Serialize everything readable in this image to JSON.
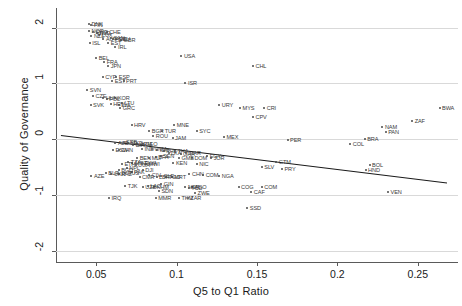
{
  "chart_data": {
    "type": "scatter",
    "title": "",
    "xlabel": "Q5 to Q1 Ratio",
    "ylabel": "Quality of Governance",
    "xlim": [
      0.025,
      0.275
    ],
    "ylim": [
      -2.2,
      2.35
    ],
    "xticks": [
      0.05,
      0.1,
      0.15,
      0.2,
      0.25
    ],
    "xticklabels": [
      "0.05",
      "0.1",
      "0.15",
      "0.2",
      "0.25"
    ],
    "yticks": [
      -2,
      -1,
      0,
      1,
      2
    ],
    "yticklabels": [
      "-2",
      "-1",
      "0",
      "1",
      "2"
    ],
    "grid": "horizontal",
    "legend": "none",
    "marker_color": "#4a4a4a",
    "label_color": "#3a3a3a",
    "fit_line_color": "#1a1a1a",
    "fit_line": {
      "x0": 0.028,
      "y0": 0.07,
      "x1": 0.268,
      "y1": -0.78,
      "slope": -3.54,
      "intercept": 0.169
    },
    "points": [
      {
        "label": "DNK",
        "x": 0.0455,
        "y": 2.07
      },
      {
        "label": "FIN",
        "x": 0.047,
        "y": 2.04
      },
      {
        "label": "NOR",
        "x": 0.0455,
        "y": 1.93
      },
      {
        "label": "SWE",
        "x": 0.048,
        "y": 1.92
      },
      {
        "label": "NLD",
        "x": 0.0505,
        "y": 1.91
      },
      {
        "label": "CHE",
        "x": 0.0565,
        "y": 1.92
      },
      {
        "label": "LUX",
        "x": 0.052,
        "y": 1.86
      },
      {
        "label": "NZL",
        "x": 0.047,
        "y": 1.84
      },
      {
        "label": "AUT",
        "x": 0.0545,
        "y": 1.8
      },
      {
        "label": "CAN",
        "x": 0.059,
        "y": 1.82
      },
      {
        "label": "AUS",
        "x": 0.0605,
        "y": 1.8
      },
      {
        "label": "DEU",
        "x": 0.0625,
        "y": 1.79
      },
      {
        "label": "GBR",
        "x": 0.0655,
        "y": 1.77
      },
      {
        "label": "ISL",
        "x": 0.046,
        "y": 1.73
      },
      {
        "label": "EST",
        "x": 0.0575,
        "y": 1.72
      },
      {
        "label": "IRL",
        "x": 0.062,
        "y": 1.66
      },
      {
        "label": "BEL",
        "x": 0.05,
        "y": 1.46
      },
      {
        "label": "FRA",
        "x": 0.055,
        "y": 1.38
      },
      {
        "label": "JPN",
        "x": 0.0575,
        "y": 1.31
      },
      {
        "label": "USA",
        "x": 0.103,
        "y": 1.49
      },
      {
        "label": "CHL",
        "x": 0.1475,
        "y": 1.31
      },
      {
        "label": "CYP",
        "x": 0.054,
        "y": 1.11
      },
      {
        "label": "ESP",
        "x": 0.0625,
        "y": 1.11
      },
      {
        "label": "EST2",
        "x": 0.06,
        "y": 1.05
      },
      {
        "label": "PRT",
        "x": 0.067,
        "y": 1.05
      },
      {
        "label": "ISR",
        "x": 0.1055,
        "y": 1.01
      },
      {
        "label": "SVN",
        "x": 0.0445,
        "y": 0.88
      },
      {
        "label": "CZE",
        "x": 0.048,
        "y": 0.78
      },
      {
        "label": "HUN",
        "x": 0.0545,
        "y": 0.73
      },
      {
        "label": "POL",
        "x": 0.0565,
        "y": 0.72
      },
      {
        "label": "KOR",
        "x": 0.062,
        "y": 0.74
      },
      {
        "label": "SVK",
        "x": 0.0465,
        "y": 0.62
      },
      {
        "label": "HRV2",
        "x": 0.059,
        "y": 0.63
      },
      {
        "label": "LVA",
        "x": 0.064,
        "y": 0.62
      },
      {
        "label": "LTU",
        "x": 0.066,
        "y": 0.64
      },
      {
        "label": "GRC",
        "x": 0.065,
        "y": 0.55
      },
      {
        "label": "URY",
        "x": 0.1265,
        "y": 0.62
      },
      {
        "label": "MYS",
        "x": 0.1395,
        "y": 0.56
      },
      {
        "label": "CRI",
        "x": 0.1545,
        "y": 0.56
      },
      {
        "label": "CPV",
        "x": 0.1475,
        "y": 0.4
      },
      {
        "label": "HRV",
        "x": 0.072,
        "y": 0.25
      },
      {
        "label": "MNE",
        "x": 0.0985,
        "y": 0.26
      },
      {
        "label": "BGR",
        "x": 0.083,
        "y": 0.15
      },
      {
        "label": "TUR",
        "x": 0.091,
        "y": 0.15
      },
      {
        "label": "SYC",
        "x": 0.1125,
        "y": 0.15
      },
      {
        "label": "ROU",
        "x": 0.0855,
        "y": 0.06
      },
      {
        "label": "JAM",
        "x": 0.0975,
        "y": 0.03
      },
      {
        "label": "MEX",
        "x": 0.1295,
        "y": 0.04
      },
      {
        "label": "PER",
        "x": 0.169,
        "y": -0.02
      },
      {
        "label": "NAM",
        "x": 0.228,
        "y": 0.22
      },
      {
        "label": "PAN",
        "x": 0.23,
        "y": 0.12
      },
      {
        "label": "BWA",
        "x": 0.2635,
        "y": 0.56
      },
      {
        "label": "ZAF",
        "x": 0.2465,
        "y": 0.33
      },
      {
        "label": "BRA",
        "x": 0.217,
        "y": 0.0
      },
      {
        "label": "COL",
        "x": 0.208,
        "y": -0.08
      },
      {
        "label": "ALB",
        "x": 0.062,
        "y": -0.06
      },
      {
        "label": "SRB",
        "x": 0.067,
        "y": -0.05
      },
      {
        "label": "MKD",
        "x": 0.07,
        "y": -0.07
      },
      {
        "label": "BIH",
        "x": 0.073,
        "y": -0.1
      },
      {
        "label": "ARM",
        "x": 0.0755,
        "y": -0.08
      },
      {
        "label": "GEO",
        "x": 0.079,
        "y": -0.09
      },
      {
        "label": "IND",
        "x": 0.0785,
        "y": -0.17
      },
      {
        "label": "CHN",
        "x": 0.064,
        "y": -0.19
      },
      {
        "label": "ESW",
        "x": 0.0605,
        "y": -0.2
      },
      {
        "label": "VNM",
        "x": 0.0845,
        "y": -0.18
      },
      {
        "label": "IDN",
        "x": 0.088,
        "y": -0.2
      },
      {
        "label": "PHL",
        "x": 0.092,
        "y": -0.22
      },
      {
        "label": "LKA",
        "x": 0.095,
        "y": -0.24
      },
      {
        "label": "THA",
        "x": 0.099,
        "y": -0.22
      },
      {
        "label": "GHA",
        "x": 0.1025,
        "y": -0.26
      },
      {
        "label": "MAR",
        "x": 0.106,
        "y": -0.24
      },
      {
        "label": "BEN",
        "x": 0.0755,
        "y": -0.34
      },
      {
        "label": "MLI",
        "x": 0.083,
        "y": -0.33
      },
      {
        "label": "BFA",
        "x": 0.087,
        "y": -0.32
      },
      {
        "label": "SEN",
        "x": 0.09,
        "y": -0.3
      },
      {
        "label": "GMB",
        "x": 0.1015,
        "y": -0.33
      },
      {
        "label": "DOM",
        "x": 0.1095,
        "y": -0.33
      },
      {
        "label": "EGY",
        "x": 0.119,
        "y": -0.31
      },
      {
        "label": "JOR",
        "x": 0.1215,
        "y": -0.33
      },
      {
        "label": "KEN",
        "x": 0.098,
        "y": -0.43
      },
      {
        "label": "NIC",
        "x": 0.1125,
        "y": -0.44
      },
      {
        "label": "GTM",
        "x": 0.162,
        "y": -0.41
      },
      {
        "label": "SLV",
        "x": 0.153,
        "y": -0.49
      },
      {
        "label": "PRY",
        "x": 0.1655,
        "y": -0.53
      },
      {
        "label": "BOL",
        "x": 0.22,
        "y": -0.47
      },
      {
        "label": "HND",
        "x": 0.2175,
        "y": -0.56
      },
      {
        "label": "MOZ",
        "x": 0.0725,
        "y": -0.42
      },
      {
        "label": "ETH",
        "x": 0.066,
        "y": -0.44
      },
      {
        "label": "TZA",
        "x": 0.07,
        "y": -0.4
      },
      {
        "label": "UGA",
        "x": 0.0745,
        "y": -0.47
      },
      {
        "label": "RWA",
        "x": 0.0785,
        "y": -0.42
      },
      {
        "label": "MWI",
        "x": 0.081,
        "y": -0.45
      },
      {
        "label": "DJI",
        "x": 0.079,
        "y": -0.55
      },
      {
        "label": "NPL",
        "x": 0.069,
        "y": -0.52
      },
      {
        "label": "BGD",
        "x": 0.064,
        "y": -0.55
      },
      {
        "label": "PAK",
        "x": 0.072,
        "y": -0.58
      },
      {
        "label": "KAZ",
        "x": 0.064,
        "y": -0.63
      },
      {
        "label": "AZE",
        "x": 0.047,
        "y": -0.66
      },
      {
        "label": "BLR",
        "x": 0.056,
        "y": -0.6
      },
      {
        "label": "UKR",
        "x": 0.0595,
        "y": -0.62
      },
      {
        "label": "RUS",
        "x": 0.068,
        "y": -0.6
      },
      {
        "label": "CMR",
        "x": 0.077,
        "y": -0.67
      },
      {
        "label": "CIV",
        "x": 0.083,
        "y": -0.65
      },
      {
        "label": "LBR",
        "x": 0.0875,
        "y": -0.67
      },
      {
        "label": "SLE",
        "x": 0.0905,
        "y": -0.66
      },
      {
        "label": "TGO",
        "x": 0.0935,
        "y": -0.68
      },
      {
        "label": "MRT",
        "x": 0.097,
        "y": -0.67
      },
      {
        "label": "CHN2",
        "x": 0.108,
        "y": -0.62
      },
      {
        "label": "COM2",
        "x": 0.1165,
        "y": -0.64
      },
      {
        "label": "NGA",
        "x": 0.1265,
        "y": -0.66
      },
      {
        "label": "TJK",
        "x": 0.068,
        "y": -0.83
      },
      {
        "label": "UZB",
        "x": 0.079,
        "y": -0.85
      },
      {
        "label": "LAO",
        "x": 0.082,
        "y": -0.83
      },
      {
        "label": "KHM",
        "x": 0.086,
        "y": -0.85
      },
      {
        "label": "GIN",
        "x": 0.0905,
        "y": -0.8
      },
      {
        "label": "AGO",
        "x": 0.1095,
        "y": -0.86
      },
      {
        "label": "NER",
        "x": 0.1055,
        "y": -0.85
      },
      {
        "label": "TCD",
        "x": 0.1075,
        "y": -0.87
      },
      {
        "label": "SDN",
        "x": 0.089,
        "y": -0.92
      },
      {
        "label": "ZWE",
        "x": 0.1115,
        "y": -0.96
      },
      {
        "label": "IRQ",
        "x": 0.058,
        "y": -1.06
      },
      {
        "label": "MMR",
        "x": 0.087,
        "y": -1.06
      },
      {
        "label": "TKM",
        "x": 0.1015,
        "y": -1.06
      },
      {
        "label": "ZAR",
        "x": 0.107,
        "y": -1.06
      },
      {
        "label": "COG",
        "x": 0.1385,
        "y": -0.85
      },
      {
        "label": "COM",
        "x": 0.153,
        "y": -0.85
      },
      {
        "label": "CAF",
        "x": 0.1465,
        "y": -0.94
      },
      {
        "label": "SSD",
        "x": 0.144,
        "y": -1.24
      },
      {
        "label": "VEN",
        "x": 0.2315,
        "y": -0.94
      }
    ]
  }
}
